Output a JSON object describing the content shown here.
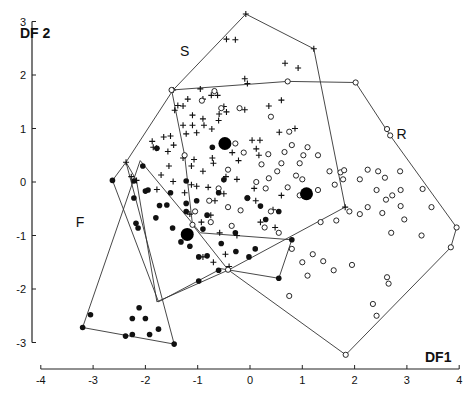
{
  "chart_data": {
    "type": "scatter",
    "title": "",
    "xlabel": "DF1",
    "ylabel": "DF 2",
    "xlim": [
      -4,
      4
    ],
    "ylim": [
      -3,
      3
    ],
    "xticks": [
      -4,
      -3,
      -2,
      -1,
      0,
      1,
      2,
      3,
      4
    ],
    "yticks": [
      -3,
      -2,
      -1,
      0,
      1,
      2,
      3
    ],
    "grid": false,
    "legend": "none",
    "group_labels": [
      {
        "text": "S",
        "x": -1.25,
        "y": 2.35
      },
      {
        "text": "R",
        "x": 2.9,
        "y": 0.8
      },
      {
        "text": "F",
        "x": -3.25,
        "y": -0.85
      }
    ],
    "series": [
      {
        "name": "S",
        "marker": "plus",
        "hull": [
          [
            -0.08,
            3.14
          ],
          [
            1.22,
            2.49
          ],
          [
            1.82,
            -0.47
          ],
          [
            -0.4,
            -1.64
          ],
          [
            -1.78,
            -2.24
          ],
          [
            -2.17,
            0.03
          ],
          [
            -2.37,
            0.37
          ],
          [
            -1.47,
            1.72
          ]
        ],
        "points": [
          [
            -0.08,
            3.14
          ],
          [
            1.22,
            2.49
          ],
          [
            -0.45,
            2.67
          ],
          [
            -0.28,
            2.66
          ],
          [
            0.67,
            2.22
          ],
          [
            0.92,
            2.13
          ],
          [
            -0.1,
            1.93
          ],
          [
            -0.05,
            1.84
          ],
          [
            0.6,
            1.53
          ],
          [
            -0.9,
            1.55
          ],
          [
            -0.95,
            1.74
          ],
          [
            -0.74,
            1.62
          ],
          [
            -0.62,
            1.62
          ],
          [
            -1.47,
            1.72
          ],
          [
            -1.19,
            1.55
          ],
          [
            -0.5,
            1.41
          ],
          [
            -0.45,
            1.31
          ],
          [
            -0.1,
            1.35
          ],
          [
            -1.38,
            1.43
          ],
          [
            -1.28,
            1.42
          ],
          [
            -0.59,
            1.27
          ],
          [
            -0.6,
            1.15
          ],
          [
            -0.9,
            1.18
          ],
          [
            -1.1,
            1.25
          ],
          [
            -1.44,
            1.34
          ],
          [
            -1.28,
            1.06
          ],
          [
            -1.22,
            0.9
          ],
          [
            -1.02,
            0.92
          ],
          [
            -1.1,
            1.06
          ],
          [
            -0.88,
            1.06
          ],
          [
            -0.73,
            0.99
          ],
          [
            -1.52,
            0.86
          ],
          [
            -1.65,
            0.84
          ],
          [
            -1.87,
            0.76
          ],
          [
            -1.46,
            0.69
          ],
          [
            -1.57,
            0.57
          ],
          [
            -1.85,
            0.65
          ],
          [
            -1.79,
            0.63
          ],
          [
            -1.55,
            0.3
          ],
          [
            -1.28,
            0.45
          ],
          [
            -1.07,
            0.42
          ],
          [
            -0.72,
            0.45
          ],
          [
            -0.34,
            0.55
          ],
          [
            -1.12,
            0.3
          ],
          [
            -0.9,
            0.2
          ],
          [
            -0.7,
            0.35
          ],
          [
            -0.22,
            0.4
          ],
          [
            0.12,
            0.62
          ],
          [
            0.19,
            0.78
          ],
          [
            0.17,
            0.5
          ],
          [
            -2.37,
            0.37
          ],
          [
            -2.27,
            0.1
          ],
          [
            -2.17,
            0.03
          ],
          [
            -1.78,
            -0.14
          ],
          [
            -1.7,
            0.13
          ],
          [
            -1.47,
            0.01
          ],
          [
            -1.25,
            -0.2
          ],
          [
            -1.02,
            -0.08
          ],
          [
            -0.8,
            -0.1
          ],
          [
            -0.67,
            -0.35
          ],
          [
            -0.46,
            0.1
          ],
          [
            -0.25,
            0.05
          ],
          [
            0.08,
            -0.12
          ],
          [
            0.11,
            -0.35
          ],
          [
            0.44,
            -0.52
          ],
          [
            0.6,
            -0.25
          ],
          [
            0.04,
            0.78
          ],
          [
            0.36,
            1.42
          ],
          [
            0.56,
            0.93
          ],
          [
            0.86,
            1.0
          ],
          [
            -1.15,
            -0.6
          ],
          [
            -0.93,
            -0.75
          ],
          [
            -0.58,
            -0.95
          ],
          [
            -0.25,
            -1.0
          ],
          [
            -0.47,
            -1.35
          ],
          [
            -0.4,
            -1.58
          ],
          [
            0.2,
            -0.75
          ],
          [
            0.48,
            -0.85
          ],
          [
            1.82,
            -0.47
          ],
          [
            -1.12,
            -0.05
          ],
          [
            -0.75,
            -0.62
          ],
          [
            -0.5,
            -0.22
          ],
          [
            -0.9,
            -1.4
          ],
          [
            -0.7,
            -1.5
          ]
        ]
      },
      {
        "name": "R",
        "marker": "open-circle",
        "hull": [
          [
            -1.5,
            1.72
          ],
          [
            0.72,
            1.88
          ],
          [
            2.02,
            1.86
          ],
          [
            2.68,
            0.87
          ],
          [
            3.95,
            -0.85
          ],
          [
            3.84,
            -1.22
          ],
          [
            1.83,
            -3.23
          ],
          [
            -0.42,
            -1.64
          ],
          [
            -1.1,
            -0.8
          ],
          [
            -1.25,
            0.5
          ]
        ],
        "points": [
          [
            -1.5,
            1.72
          ],
          [
            0.72,
            1.88
          ],
          [
            2.02,
            1.86
          ],
          [
            2.62,
            0.99
          ],
          [
            2.68,
            0.87
          ],
          [
            3.95,
            -0.85
          ],
          [
            3.84,
            -1.22
          ],
          [
            1.83,
            -3.23
          ],
          [
            -0.42,
            -1.64
          ],
          [
            -1.1,
            -0.8
          ],
          [
            -1.25,
            0.5
          ],
          [
            -0.92,
            1.52
          ],
          [
            -0.55,
            1.38
          ],
          [
            -0.2,
            1.38
          ],
          [
            -0.68,
            1.7
          ],
          [
            0.4,
            1.22
          ],
          [
            0.75,
            0.94
          ],
          [
            1.1,
            0.65
          ],
          [
            0.8,
            0.69
          ],
          [
            1.02,
            0.5
          ],
          [
            1.3,
            0.5
          ],
          [
            0.66,
            0.56
          ],
          [
            0.95,
            0.35
          ],
          [
            1.52,
            0.2
          ],
          [
            1.73,
            0.18
          ],
          [
            1.78,
            0.05
          ],
          [
            1.8,
            0.22
          ],
          [
            1.62,
            -0.05
          ],
          [
            1.3,
            -0.15
          ],
          [
            1.0,
            0.05
          ],
          [
            0.88,
            0.12
          ],
          [
            0.72,
            -0.1
          ],
          [
            0.95,
            -0.25
          ],
          [
            0.6,
            0.35
          ],
          [
            0.52,
            0.2
          ],
          [
            0.36,
            0.07
          ],
          [
            0.12,
            0.0
          ],
          [
            0.3,
            -0.12
          ],
          [
            -0.05,
            -0.3
          ],
          [
            0.4,
            -0.55
          ],
          [
            0.35,
            0.52
          ],
          [
            0.22,
            0.33
          ],
          [
            -0.28,
            0.72
          ],
          [
            -0.12,
            0.55
          ],
          [
            -0.42,
            0.23
          ],
          [
            -0.6,
            -0.12
          ],
          [
            -0.78,
            -0.35
          ],
          [
            -0.42,
            -0.47
          ],
          [
            -0.18,
            -0.53
          ],
          [
            0.28,
            -0.85
          ],
          [
            0.55,
            -0.95
          ],
          [
            -0.35,
            -0.82
          ],
          [
            -0.75,
            -0.75
          ],
          [
            -1.05,
            -0.55
          ],
          [
            1.9,
            -0.55
          ],
          [
            2.1,
            -0.6
          ],
          [
            2.25,
            -0.47
          ],
          [
            2.42,
            -0.15
          ],
          [
            2.1,
            0.05
          ],
          [
            2.25,
            0.23
          ],
          [
            2.58,
            0.08
          ],
          [
            2.45,
            0.2
          ],
          [
            2.87,
            0.2
          ],
          [
            2.88,
            -0.15
          ],
          [
            2.72,
            -0.25
          ],
          [
            2.6,
            -0.33
          ],
          [
            2.53,
            -0.58
          ],
          [
            2.95,
            -0.7
          ],
          [
            2.7,
            -0.95
          ],
          [
            3.28,
            -1.0
          ],
          [
            2.88,
            -0.45
          ],
          [
            1.35,
            -0.75
          ],
          [
            1.65,
            -0.72
          ],
          [
            1.2,
            -1.35
          ],
          [
            1.0,
            -1.5
          ],
          [
            0.8,
            -1.25
          ],
          [
            2.65,
            -1.9
          ],
          [
            2.62,
            -1.78
          ],
          [
            2.35,
            -2.28
          ],
          [
            2.42,
            -2.5
          ],
          [
            0.75,
            -2.13
          ],
          [
            1.1,
            -1.75
          ],
          [
            1.4,
            -1.48
          ],
          [
            1.6,
            -1.65
          ],
          [
            1.95,
            -1.55
          ],
          [
            3.3,
            -0.13
          ],
          [
            3.47,
            -0.47
          ]
        ]
      },
      {
        "name": "F",
        "marker": "filled-circle",
        "hull": [
          [
            -2.63,
            0.03
          ],
          [
            -1.75,
            -2.24
          ],
          [
            -0.55,
            -1.62
          ],
          [
            0.55,
            -1.8
          ],
          [
            0.8,
            -1.08
          ],
          [
            -0.95,
            -0.95
          ],
          [
            -2.1,
            0.4
          ],
          [
            -3.2,
            -2.72
          ],
          [
            -1.45,
            -3.03
          ],
          [
            -2.37,
            0.37
          ]
        ],
        "points": [
          [
            -2.63,
            0.03
          ],
          [
            -2.22,
            0.02
          ],
          [
            -2.22,
            -0.3
          ],
          [
            -2.0,
            -0.17
          ],
          [
            -1.95,
            -0.15
          ],
          [
            -1.73,
            -0.44
          ],
          [
            -2.18,
            -0.77
          ],
          [
            -2.14,
            -0.86
          ],
          [
            -1.8,
            -0.67
          ],
          [
            -1.59,
            -0.43
          ],
          [
            -1.48,
            -0.86
          ],
          [
            -1.22,
            -0.55
          ],
          [
            -1.02,
            -0.35
          ],
          [
            -0.82,
            -0.62
          ],
          [
            -0.9,
            -0.88
          ],
          [
            -0.55,
            -1.15
          ],
          [
            -0.28,
            -0.95
          ],
          [
            -1.22,
            -0.4
          ],
          [
            -0.6,
            -0.2
          ],
          [
            -0.72,
            0.65
          ],
          [
            -1.78,
            0.63
          ],
          [
            -2.05,
            0.3
          ],
          [
            -1.52,
            -0.2
          ],
          [
            -1.22,
            0.02
          ],
          [
            -0.5,
            0.04
          ],
          [
            -0.05,
            -0.3
          ],
          [
            0.2,
            -0.45
          ],
          [
            0.3,
            -0.7
          ],
          [
            0.55,
            -0.55
          ],
          [
            0.8,
            -1.08
          ],
          [
            -0.27,
            -1.3
          ],
          [
            -0.02,
            -1.4
          ],
          [
            0.1,
            -1.25
          ],
          [
            0.55,
            -1.8
          ],
          [
            -0.98,
            -1.85
          ],
          [
            -2.12,
            -2.35
          ],
          [
            -2.25,
            -2.55
          ],
          [
            -2.0,
            -2.55
          ],
          [
            -1.92,
            -2.85
          ],
          [
            -2.25,
            -2.85
          ],
          [
            -1.75,
            -2.75
          ],
          [
            -3.2,
            -2.72
          ],
          [
            -3.05,
            -2.48
          ],
          [
            -2.38,
            -2.88
          ],
          [
            -1.45,
            -3.03
          ],
          [
            -0.82,
            -1.38
          ],
          [
            -0.6,
            -1.65
          ],
          [
            -1.15,
            -1.2
          ],
          [
            -1.32,
            -1.12
          ],
          [
            -0.98,
            -1.4
          ]
        ]
      }
    ],
    "centroids": [
      {
        "group": "S",
        "x": -0.48,
        "y": 0.72
      },
      {
        "group": "R",
        "x": 1.08,
        "y": -0.22
      },
      {
        "group": "F",
        "x": -1.2,
        "y": -0.98
      }
    ]
  }
}
